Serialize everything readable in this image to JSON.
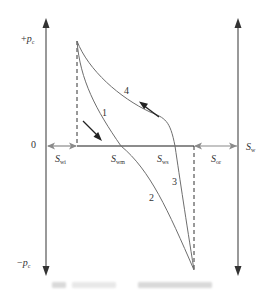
{
  "figure": {
    "type": "capillary-pressure-saturation-hysteresis-diagram",
    "axes": {
      "y_top_label": {
        "sign": "+",
        "symbol": "p",
        "sub": "c"
      },
      "y_bottom_label": {
        "sign": "−",
        "symbol": "p",
        "sub": "c"
      },
      "origin_label": "0",
      "x_right_label": {
        "symbol": "S",
        "sub": "w"
      }
    },
    "saturation_labels": [
      {
        "symbol": "S",
        "sub": "wi"
      },
      {
        "symbol": "S",
        "sub": "wm"
      },
      {
        "symbol": "S",
        "sub": "ws"
      },
      {
        "symbol": "S",
        "sub": "or"
      }
    ],
    "curves": [
      {
        "id": "1",
        "label": "1"
      },
      {
        "id": "2",
        "label": "2"
      },
      {
        "id": "3",
        "label": "3"
      },
      {
        "id": "4",
        "label": "4"
      }
    ],
    "direction_arrows": [
      {
        "name": "drainage-arrow",
        "direction": "down-right"
      },
      {
        "name": "imbibition-arrow",
        "direction": "up-left"
      }
    ],
    "colors": {
      "axis": "#444444",
      "curve": "#6e6e6e",
      "arrow": "#222222",
      "double_arrow": "#8a8a8a"
    },
    "caption_legible": false
  }
}
